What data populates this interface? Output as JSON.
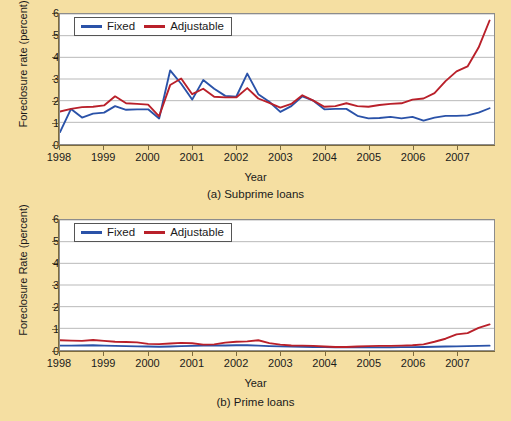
{
  "figure": {
    "background_color": "#f5dfa2",
    "series_colors": {
      "fixed": "#2a52a8",
      "adjustable": "#b9202a"
    }
  },
  "panel_a": {
    "caption": "(a) Subprime loans",
    "ylabel": "Foreclosure rate (percent)",
    "xlabel": "Year",
    "legend": {
      "fixed": "Fixed",
      "adjustable": "Adjustable"
    }
  },
  "panel_b": {
    "caption": "(b) Prime loans",
    "ylabel": "Foreclosure Rate (percent)",
    "xlabel": "Year",
    "legend": {
      "fixed": "Fixed",
      "adjustable": "Adjustable"
    }
  },
  "chart_data": [
    {
      "type": "line",
      "id": "subprime",
      "title": "(a) Subprime loans",
      "xlabel": "Year",
      "ylabel": "Foreclosure rate (percent)",
      "xlim": [
        1998.0,
        2007.85
      ],
      "ylim": [
        0,
        6
      ],
      "yticks": [
        0,
        1,
        2,
        3,
        4,
        5,
        6
      ],
      "xticks": [
        1998,
        1999,
        2000,
        2001,
        2002,
        2003,
        2004,
        2005,
        2006,
        2007
      ],
      "grid": "horizontal",
      "legend_position": "top-left",
      "x": [
        1998.0,
        1998.25,
        1998.5,
        1998.75,
        1999.0,
        1999.25,
        1999.5,
        1999.75,
        2000.0,
        2000.25,
        2000.5,
        2000.75,
        2001.0,
        2001.25,
        2001.5,
        2001.75,
        2002.0,
        2002.25,
        2002.5,
        2002.75,
        2003.0,
        2003.25,
        2003.5,
        2003.75,
        2004.0,
        2004.25,
        2004.5,
        2004.75,
        2005.0,
        2005.25,
        2005.5,
        2005.75,
        2006.0,
        2006.25,
        2006.5,
        2006.75,
        2007.0,
        2007.25,
        2007.5,
        2007.75
      ],
      "series": [
        {
          "name": "Fixed",
          "color": "#2a52a8",
          "values": [
            0.55,
            1.62,
            1.22,
            1.4,
            1.45,
            1.75,
            1.58,
            1.6,
            1.6,
            1.18,
            3.4,
            2.78,
            2.05,
            2.95,
            2.55,
            2.22,
            2.18,
            3.25,
            2.3,
            1.95,
            1.48,
            1.75,
            2.2,
            2.0,
            1.6,
            1.62,
            1.62,
            1.3,
            1.18,
            1.2,
            1.25,
            1.18,
            1.25,
            1.08,
            1.22,
            1.3,
            1.3,
            1.32,
            1.45,
            1.65
          ]
        },
        {
          "name": "Adjustable",
          "color": "#b9202a",
          "values": [
            1.5,
            1.62,
            1.7,
            1.72,
            1.78,
            2.2,
            1.88,
            1.85,
            1.82,
            1.28,
            2.72,
            3.02,
            2.3,
            2.55,
            2.18,
            2.15,
            2.15,
            2.58,
            2.1,
            1.9,
            1.68,
            1.85,
            2.25,
            2.0,
            1.72,
            1.75,
            1.88,
            1.75,
            1.72,
            1.8,
            1.85,
            1.88,
            2.05,
            2.1,
            2.35,
            2.9,
            3.35,
            3.58,
            4.45,
            5.7
          ]
        }
      ]
    },
    {
      "type": "line",
      "id": "prime",
      "title": "(b) Prime loans",
      "xlabel": "Year",
      "ylabel": "Foreclosure Rate (percent)",
      "xlim": [
        1998.0,
        2007.85
      ],
      "ylim": [
        0,
        6
      ],
      "yticks": [
        0,
        1,
        2,
        3,
        4,
        5,
        6
      ],
      "xticks": [
        1998,
        1999,
        2000,
        2001,
        2002,
        2003,
        2004,
        2005,
        2006,
        2007
      ],
      "grid": "horizontal",
      "legend_position": "top-left",
      "x": [
        1998.0,
        1998.25,
        1998.5,
        1998.75,
        1999.0,
        1999.25,
        1999.5,
        1999.75,
        2000.0,
        2000.25,
        2000.5,
        2000.75,
        2001.0,
        2001.25,
        2001.5,
        2001.75,
        2002.0,
        2002.25,
        2002.5,
        2002.75,
        2003.0,
        2003.25,
        2003.5,
        2003.75,
        2004.0,
        2004.25,
        2004.5,
        2004.75,
        2005.0,
        2005.25,
        2005.5,
        2005.75,
        2006.0,
        2006.25,
        2006.5,
        2006.75,
        2007.0,
        2007.25,
        2007.5,
        2007.75
      ],
      "series": [
        {
          "name": "Fixed",
          "color": "#2a52a8",
          "values": [
            0.2,
            0.2,
            0.21,
            0.22,
            0.2,
            0.19,
            0.18,
            0.17,
            0.16,
            0.15,
            0.16,
            0.18,
            0.19,
            0.2,
            0.21,
            0.21,
            0.22,
            0.22,
            0.2,
            0.18,
            0.17,
            0.16,
            0.15,
            0.14,
            0.13,
            0.12,
            0.12,
            0.12,
            0.12,
            0.12,
            0.12,
            0.13,
            0.13,
            0.14,
            0.15,
            0.16,
            0.17,
            0.18,
            0.19,
            0.2
          ]
        },
        {
          "name": "Adjustable",
          "color": "#b9202a",
          "values": [
            0.45,
            0.43,
            0.42,
            0.46,
            0.42,
            0.38,
            0.37,
            0.35,
            0.28,
            0.27,
            0.3,
            0.33,
            0.31,
            0.25,
            0.26,
            0.34,
            0.38,
            0.4,
            0.45,
            0.32,
            0.25,
            0.21,
            0.2,
            0.19,
            0.16,
            0.14,
            0.14,
            0.16,
            0.18,
            0.19,
            0.19,
            0.2,
            0.22,
            0.26,
            0.38,
            0.52,
            0.72,
            0.78,
            1.02,
            1.18
          ]
        }
      ]
    }
  ]
}
